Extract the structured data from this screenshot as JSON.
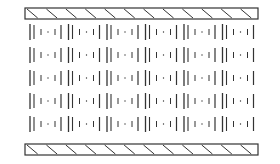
{
  "diagram": {
    "colors": {
      "stroke": "#333333",
      "background": "#ffffff"
    },
    "top_plate": {
      "x": 25,
      "y": 8,
      "width": 233,
      "height": 11,
      "hatch_count": 12
    },
    "bottom_plate": {
      "x": 25,
      "y": 144,
      "width": 233,
      "height": 11,
      "hatch_count": 12
    },
    "rows": {
      "count": 5,
      "centers_y": [
        32,
        55,
        78,
        101,
        124
      ],
      "bar_height": 16
    },
    "units_per_row": 6,
    "unit_x_start": 30,
    "unit_width": 38.5,
    "unit_pattern": [
      "long-bar",
      "long-bar",
      "short-tick",
      "dot",
      "short-tick",
      "long-bar"
    ]
  }
}
